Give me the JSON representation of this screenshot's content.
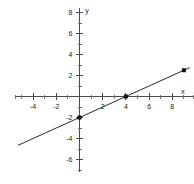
{
  "chart_data": {
    "type": "line",
    "title": "",
    "xlabel": "x",
    "ylabel": "y",
    "grid": false,
    "legend": null,
    "xlim": [
      -5.5,
      9.8
    ],
    "ylim": [
      -7.2,
      8.4
    ],
    "x_ticks_labeled": [
      -4,
      -2,
      2,
      4,
      6,
      8
    ],
    "y_ticks_labeled": [
      -6,
      -4,
      -2,
      2,
      4,
      6,
      8
    ],
    "x_tick_labels": [
      "-4",
      "-2",
      "2",
      "4",
      "6",
      "8"
    ],
    "y_tick_labels": [
      "-6",
      "-4",
      "-2",
      "2",
      "4",
      "6",
      "8"
    ],
    "x_tick_step": 1,
    "y_tick_step": 1,
    "series": [
      {
        "name": "line",
        "equation": "y = 0.5x - 2",
        "slope": 0.5,
        "intercept": -2,
        "x": [
          -5.3,
          9.5
        ],
        "values": [
          -4.65,
          2.75
        ]
      }
    ],
    "points": [
      {
        "label": "y-intercept",
        "x": 0,
        "y": -2
      },
      {
        "label": "x-intercept",
        "x": 4,
        "y": 0
      },
      {
        "label": "upper-point",
        "x": 9,
        "y": 2.5
      }
    ]
  },
  "axes": {
    "x_axis_label": "x",
    "y_axis_label": "y"
  }
}
